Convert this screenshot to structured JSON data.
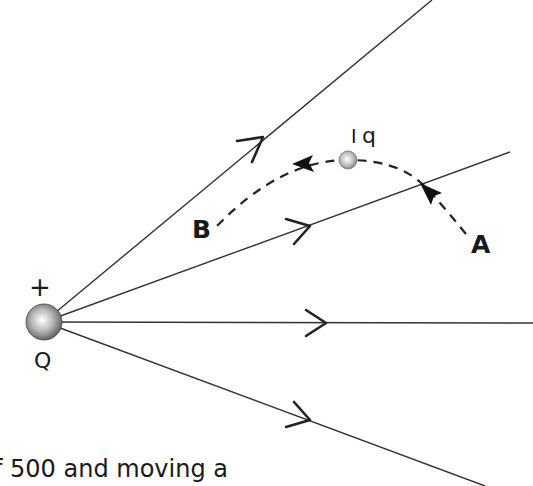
{
  "diagram": {
    "source_charge": {
      "sign_label": "+",
      "name_label": "Q"
    },
    "test_charge": {
      "tick_label": "I",
      "name_label": "q"
    },
    "points": {
      "A": "A",
      "B": "B"
    },
    "field_lines_count": 4,
    "colors": {
      "line": "#333333",
      "text": "#1a1a1a"
    }
  },
  "caption_text": "f 500 and moving a"
}
